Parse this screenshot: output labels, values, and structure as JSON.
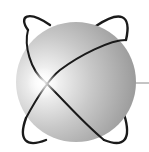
{
  "logo": {
    "name": "sphere-with-orbits",
    "colors": {
      "background": "#ffffff",
      "sphere_highlight": "#ffffff",
      "sphere_mid": "#c4c4c4",
      "sphere_shadow": "#8e8e8e",
      "orbit_ring": "#1a1a1a",
      "connector_line": "#8a8a8a"
    }
  }
}
